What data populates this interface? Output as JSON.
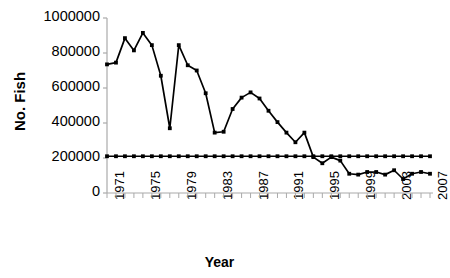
{
  "chart_data": {
    "type": "line",
    "title": "",
    "xlabel": "Year",
    "ylabel": "No. Fish",
    "xlim": [
      1971,
      2007
    ],
    "ylim": [
      0,
      1000000
    ],
    "ytick_labels": [
      "1000000",
      "800000",
      "600000",
      "400000",
      "200000",
      "0"
    ],
    "ytick_values": [
      1000000,
      800000,
      600000,
      400000,
      200000,
      0
    ],
    "xtick_labels": [
      "1971",
      "1975",
      "1979",
      "1983",
      "1987",
      "1991",
      "1995",
      "1999",
      "2003",
      "2007"
    ],
    "xtick_values": [
      1971,
      1975,
      1979,
      1983,
      1987,
      1991,
      1995,
      1999,
      2003,
      2007
    ],
    "minor_xticks_every": 1,
    "grid": false,
    "legend": "none",
    "x": [
      1971,
      1972,
      1973,
      1974,
      1975,
      1976,
      1977,
      1978,
      1979,
      1980,
      1981,
      1982,
      1983,
      1984,
      1985,
      1986,
      1987,
      1988,
      1989,
      1990,
      1991,
      1992,
      1993,
      1994,
      1995,
      1996,
      1997,
      1998,
      1999,
      2000,
      2001,
      2002,
      2003,
      2004,
      2005,
      2006,
      2007
    ],
    "series": [
      {
        "name": "No. Fish",
        "marker": "square",
        "color": "#000000",
        "values": [
          735000,
          745000,
          885000,
          815000,
          915000,
          845000,
          670000,
          370000,
          845000,
          730000,
          700000,
          570000,
          345000,
          350000,
          480000,
          545000,
          575000,
          540000,
          470000,
          405000,
          345000,
          290000,
          345000,
          205000,
          170000,
          205000,
          185000,
          110000,
          105000,
          120000,
          120000,
          105000,
          130000,
          80000,
          110000,
          120000,
          110000
        ]
      },
      {
        "name": "Reference level",
        "marker": "square",
        "color": "#000000",
        "values": [
          210000,
          210000,
          210000,
          210000,
          210000,
          210000,
          210000,
          210000,
          210000,
          210000,
          210000,
          210000,
          210000,
          210000,
          210000,
          210000,
          210000,
          210000,
          210000,
          210000,
          210000,
          210000,
          210000,
          210000,
          210000,
          210000,
          210000,
          210000,
          210000,
          210000,
          210000,
          210000,
          210000,
          210000,
          210000,
          210000,
          210000
        ]
      }
    ]
  },
  "axis_titles": {
    "y": "No. Fish",
    "x": "Year"
  }
}
